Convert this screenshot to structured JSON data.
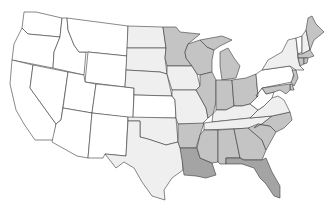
{
  "map": {
    "title": "United States choropleth map (states shaded by category)",
    "colors": {
      "none": "#ffffff",
      "low": "#efefef",
      "medium": "#c4c4c4",
      "high": "#a4a4a4",
      "border": "#3a3a3a"
    },
    "states": [
      {
        "abbr": "WA",
        "level": "none"
      },
      {
        "abbr": "OR",
        "level": "none"
      },
      {
        "abbr": "CA",
        "level": "none"
      },
      {
        "abbr": "NV",
        "level": "none"
      },
      {
        "abbr": "ID",
        "level": "none"
      },
      {
        "abbr": "MT",
        "level": "none"
      },
      {
        "abbr": "WY",
        "level": "none"
      },
      {
        "abbr": "UT",
        "level": "none"
      },
      {
        "abbr": "AZ",
        "level": "none"
      },
      {
        "abbr": "CO",
        "level": "none"
      },
      {
        "abbr": "NM",
        "level": "none"
      },
      {
        "abbr": "ND",
        "level": "low"
      },
      {
        "abbr": "SD",
        "level": "low"
      },
      {
        "abbr": "NE",
        "level": "low"
      },
      {
        "abbr": "KS",
        "level": "none"
      },
      {
        "abbr": "OK",
        "level": "low"
      },
      {
        "abbr": "TX",
        "level": "low"
      },
      {
        "abbr": "MN",
        "level": "medium"
      },
      {
        "abbr": "IA",
        "level": "low"
      },
      {
        "abbr": "MO",
        "level": "low"
      },
      {
        "abbr": "AR",
        "level": "medium"
      },
      {
        "abbr": "LA",
        "level": "high"
      },
      {
        "abbr": "WI",
        "level": "medium"
      },
      {
        "abbr": "IL",
        "level": "medium"
      },
      {
        "abbr": "MI",
        "level": "medium"
      },
      {
        "abbr": "IN",
        "level": "medium"
      },
      {
        "abbr": "OH",
        "level": "medium"
      },
      {
        "abbr": "KY",
        "level": "low"
      },
      {
        "abbr": "TN",
        "level": "low"
      },
      {
        "abbr": "MS",
        "level": "medium"
      },
      {
        "abbr": "AL",
        "level": "medium"
      },
      {
        "abbr": "GA",
        "level": "medium"
      },
      {
        "abbr": "FL",
        "level": "high"
      },
      {
        "abbr": "SC",
        "level": "medium"
      },
      {
        "abbr": "NC",
        "level": "medium"
      },
      {
        "abbr": "VA",
        "level": "low"
      },
      {
        "abbr": "WV",
        "level": "none"
      },
      {
        "abbr": "PA",
        "level": "none"
      },
      {
        "abbr": "NY",
        "level": "low"
      },
      {
        "abbr": "VT",
        "level": "none"
      },
      {
        "abbr": "NH",
        "level": "low"
      },
      {
        "abbr": "ME",
        "level": "medium"
      },
      {
        "abbr": "MA",
        "level": "medium"
      },
      {
        "abbr": "CT",
        "level": "medium"
      },
      {
        "abbr": "RI",
        "level": "medium"
      },
      {
        "abbr": "NJ",
        "level": "medium"
      },
      {
        "abbr": "DE",
        "level": "medium"
      },
      {
        "abbr": "MD",
        "level": "medium"
      }
    ]
  }
}
